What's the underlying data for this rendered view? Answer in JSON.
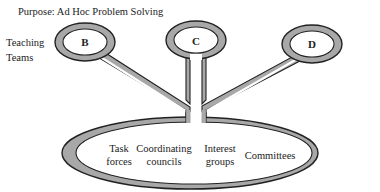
{
  "title": "Purpose: Ad Hoc Problem Solving",
  "side_label": {
    "line1": "Teaching",
    "line2": "Teams"
  },
  "nodes": [
    {
      "id": "B",
      "label": "B"
    },
    {
      "id": "C",
      "label": "C"
    },
    {
      "id": "D",
      "label": "D"
    }
  ],
  "groups": [
    {
      "line1": "Task",
      "line2": "forces"
    },
    {
      "line1": "Coordinating",
      "line2": "councils"
    },
    {
      "line1": "Interest",
      "line2": "groups"
    },
    {
      "line1": "Committees",
      "line2": ""
    }
  ],
  "colors": {
    "ring_fill": "#a8a8a8",
    "outline": "#222222",
    "background": "#ffffff"
  }
}
